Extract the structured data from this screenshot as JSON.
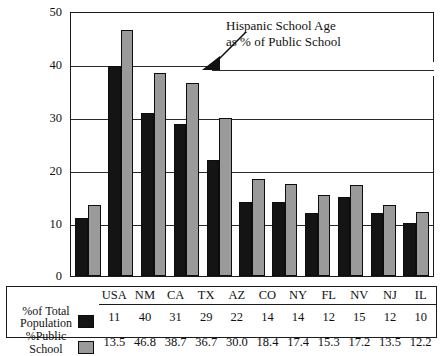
{
  "chart_data": {
    "type": "bar",
    "title": "",
    "xlabel": "",
    "ylabel": "",
    "ylim": [
      0,
      50
    ],
    "yticks": [
      0,
      10,
      20,
      30,
      40,
      50
    ],
    "grid": true,
    "legend_position": "bottom-table",
    "categories": [
      "USA",
      "NM",
      "CA",
      "TX",
      "AZ",
      "CO",
      "NY",
      "FL",
      "NV",
      "NJ",
      "IL"
    ],
    "series": [
      {
        "name": "% of Total Population",
        "color": "#141414",
        "values": [
          11,
          40,
          31,
          29,
          22,
          14,
          14,
          12,
          15,
          12,
          10
        ]
      },
      {
        "name": "% Public School",
        "color": "#9a9a9a",
        "values": [
          13.5,
          46.8,
          38.7,
          36.7,
          30.0,
          18.4,
          17.4,
          15.3,
          17.2,
          13.5,
          12.2
        ]
      }
    ],
    "annotations": [
      {
        "name": "hispanic-school-age-callout",
        "lines": [
          "Hispanic School Age",
          "as % of Public School"
        ],
        "arrow": "points-down-left"
      }
    ]
  },
  "annotation": {
    "line1": "Hispanic School Age",
    "line2": "as % of Public School"
  },
  "yaxis": {
    "t0": "0",
    "t10": "10",
    "t20": "20",
    "t30": "30",
    "t40": "40",
    "t50": "50"
  },
  "table": {
    "row1_label_line1": "%of Total",
    "row1_label_line2": "Population",
    "row2_label_line1": "%Public",
    "row2_label_line2": "School",
    "headers": [
      "USA",
      "NM",
      "CA",
      "TX",
      "AZ",
      "CO",
      "NY",
      "FL",
      "NV",
      "NJ",
      "IL"
    ],
    "row1": [
      "11",
      "40",
      "31",
      "29",
      "22",
      "14",
      "14",
      "12",
      "15",
      "12",
      "10"
    ],
    "row2": [
      "13.5",
      "46.8",
      "38.7",
      "36.7",
      "30.0",
      "18.4",
      "17.4",
      "15.3",
      "17.2",
      "13.5",
      "12.2"
    ]
  },
  "colors": {
    "series_dark": "#141414",
    "series_gray": "#9a9a9a",
    "frame": "#1b1b1b",
    "background": "#ffffff"
  }
}
